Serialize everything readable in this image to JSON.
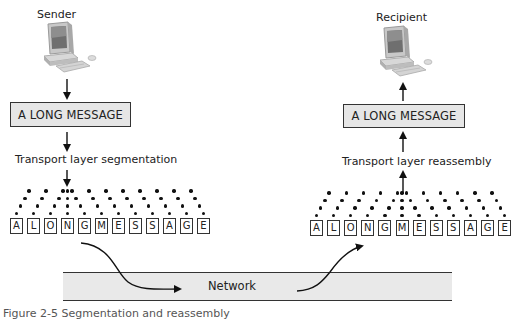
{
  "sender": {
    "label": "Sender",
    "icon": "desktop-computer-icon",
    "message": "A LONG MESSAGE",
    "process_label": "Transport layer segmentation",
    "segments": [
      "A",
      "L",
      "O",
      "N",
      "G",
      "M",
      "E",
      "S",
      "S",
      "A",
      "G",
      "E"
    ],
    "center_index": 3
  },
  "recipient": {
    "label": "Recipient",
    "icon": "desktop-computer-icon",
    "message": "A LONG MESSAGE",
    "process_label": "Transport layer reassembly",
    "segments": [
      "A",
      "L",
      "O",
      "N",
      "G",
      "M",
      "E",
      "S",
      "S",
      "A",
      "G",
      "E"
    ],
    "center_index": 5
  },
  "network": {
    "label": "Network"
  },
  "caption": {
    "text": "Figure 2-5 Segmentation and reassembly"
  },
  "colors": {
    "box_fill": "#e6e6e6",
    "band_fill": "#e9e9e9",
    "stroke": "#333333"
  }
}
